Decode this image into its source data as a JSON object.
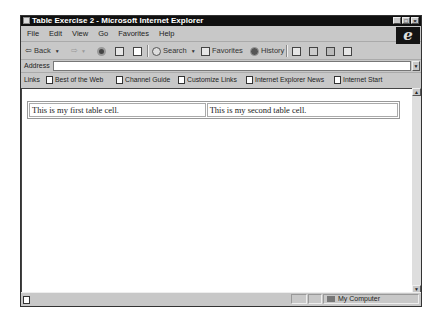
{
  "window": {
    "title": "Table Exercise 2 - Microsoft Internet Explorer",
    "controls": [
      "minimize",
      "maximize",
      "close"
    ]
  },
  "menubar": {
    "items": [
      "File",
      "Edit",
      "View",
      "Go",
      "Favorites",
      "Help"
    ]
  },
  "toolbar": {
    "back_label": "Back",
    "search_label": "Search",
    "favorites_label": "Favorites",
    "history_label": "History"
  },
  "addressbar": {
    "label": "Address",
    "value": ""
  },
  "linksbar": {
    "label": "Links",
    "items": [
      "Best of the Web",
      "Channel Guide",
      "Customize Links",
      "Internet Explorer News",
      "Internet Start"
    ]
  },
  "content": {
    "table": {
      "rows": [
        [
          "This is my first table cell.",
          "This is my second table cell."
        ]
      ]
    }
  },
  "statusbar": {
    "zone": "My Computer"
  }
}
